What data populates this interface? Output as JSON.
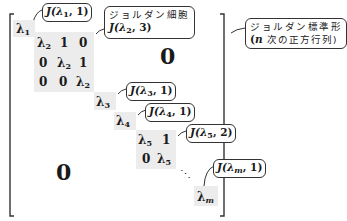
{
  "diagram": {
    "blocks": {
      "b1": {
        "entries": [
          [
            "λ1"
          ]
        ]
      },
      "b2": {
        "entries": [
          [
            "λ2",
            "1",
            "0"
          ],
          [
            "0",
            "λ2",
            "1"
          ],
          [
            "0",
            "0",
            "λ2"
          ]
        ]
      },
      "b3": {
        "entries": [
          [
            "λ3"
          ]
        ]
      },
      "b4": {
        "entries": [
          [
            "λ4"
          ]
        ]
      },
      "b5": {
        "entries": [
          [
            "λ5",
            "1"
          ],
          [
            "0",
            "λ5"
          ]
        ]
      },
      "bm": {
        "entries": [
          [
            "λm"
          ]
        ]
      }
    },
    "lambda_symbol": "λ",
    "subscripts": {
      "s1": "1",
      "s2": "2",
      "s3": "3",
      "s4": "4",
      "s5": "5",
      "sm": "m"
    },
    "one": "1",
    "zero": "0",
    "ellipsis": "⋱",
    "upper_zero": "0",
    "lower_zero": "0",
    "callouts": {
      "j1": {
        "prefix": "J(λ",
        "sub": "1",
        "suffix": ", 1)"
      },
      "j2": {
        "label": "ジョルダン細胞",
        "prefix": "J(λ",
        "sub": "2",
        "suffix": ", 3)"
      },
      "j3": {
        "prefix": "J(λ",
        "sub": "3",
        "suffix": ", 1)"
      },
      "j4": {
        "prefix": "J(λ",
        "sub": "4",
        "suffix": ", 1)"
      },
      "j5": {
        "prefix": "J(λ",
        "sub": "5",
        "suffix": ", 2)"
      },
      "jm": {
        "prefix": "J(λ",
        "sub": "m",
        "suffix": ", 1)"
      },
      "normal_form": {
        "line1": "ジョルダン標準形",
        "line2_var": "n",
        "line2_rest": " 次の正方行列)",
        "line2_open": "("
      }
    },
    "colors": {
      "shade": "#ececec",
      "ink": "#1a1a1a",
      "bracket": "#333333"
    }
  }
}
